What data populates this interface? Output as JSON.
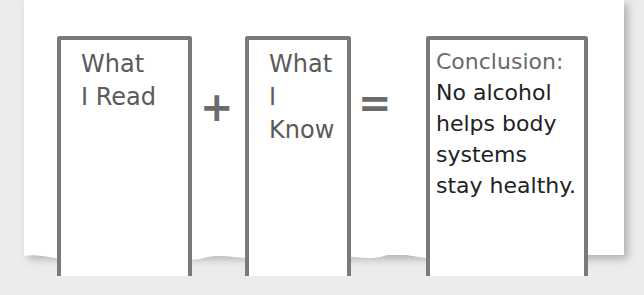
{
  "diagram": {
    "boxes": [
      {
        "label_line1": "What",
        "label_line2": "I Read"
      },
      {
        "label_line1": "What",
        "label_line2": "I Know"
      },
      {
        "title": "Conclusion:",
        "lines": [
          "No alcohol",
          "helps body",
          "systems",
          "stay healthy."
        ]
      }
    ],
    "operators": {
      "plus": "+",
      "equals": "="
    }
  },
  "colors": {
    "border": "#7a7a7a",
    "background": "#ececec",
    "paper": "#ffffff"
  }
}
